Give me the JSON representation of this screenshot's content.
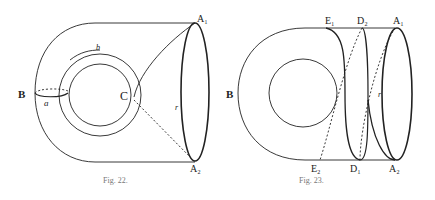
{
  "figures": [
    {
      "id": "fig22",
      "caption": "Fig. 22.",
      "labels": {
        "A1": "A₁",
        "A2": "A₂",
        "B": "B",
        "C": "C",
        "a": "a",
        "b": "b",
        "r": "r"
      }
    },
    {
      "id": "fig23",
      "caption": "Fig. 23.",
      "labels": {
        "A1": "A₁",
        "A2": "A₂",
        "B": "B",
        "E1": "E₁",
        "E2": "E₂",
        "D1": "D₁",
        "D2": "D₂",
        "r": "r"
      }
    }
  ],
  "colors": {
    "stroke": "#222222",
    "caption": "#777777"
  }
}
